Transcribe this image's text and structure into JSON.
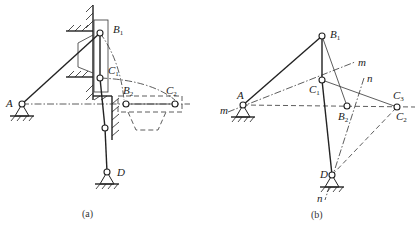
{
  "figure_a": {
    "caption": "(a)",
    "labels": {
      "A": "A",
      "B1": "B",
      "B1_sub": "1",
      "C1": "C",
      "C1_sub": "1",
      "B2": "B",
      "B2_sub": "2",
      "C2": "C",
      "C2_sub": "2",
      "D": "D"
    }
  },
  "figure_b": {
    "caption": "(b)",
    "labels": {
      "A": "A",
      "B1": "B",
      "B1_sub": "1",
      "C1": "C",
      "C1_sub": "1",
      "B2": "B",
      "B2_sub": "2",
      "C2": "C",
      "C2_sub": "2",
      "C3": "C",
      "C3_sub": "3",
      "D": "D",
      "m_left": "m",
      "m_right": "m",
      "n_top": "n",
      "n_bottom": "n"
    }
  }
}
